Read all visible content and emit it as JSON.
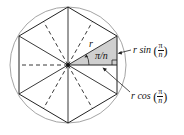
{
  "figure": {
    "n": 6,
    "colors": {
      "circle": "#9a9a9a",
      "lines": "#222222",
      "shading": "#cfcfcf"
    },
    "labels": {
      "radius": "r",
      "angle": "π/n",
      "opposite_prefix": "r sin",
      "opposite_num": "π",
      "opposite_den": "n",
      "adjacent_prefix": "r cos",
      "adjacent_num": "π",
      "adjacent_den": "n",
      "open_paren": "(",
      "close_paren": ")"
    }
  }
}
